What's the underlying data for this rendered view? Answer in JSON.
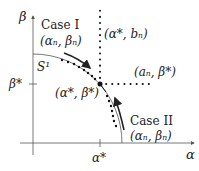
{
  "diagram": {
    "axes": {
      "x_label": "α",
      "y_label": "β",
      "x_tick_label": "α*",
      "y_tick_label": "β*"
    },
    "curve_label": "S¹",
    "point_labels": {
      "intersection": "(α*, β*)",
      "top": "(α*, bₙ)",
      "right": "(aₙ, β*)"
    },
    "cases": [
      {
        "title": "Case I",
        "sequence": "(αₙ, βₙ)"
      },
      {
        "title": "Case II",
        "sequence": "(αₙ, βₙ)"
      }
    ],
    "colors": {
      "line": "#222222",
      "axis": "#555555"
    }
  }
}
